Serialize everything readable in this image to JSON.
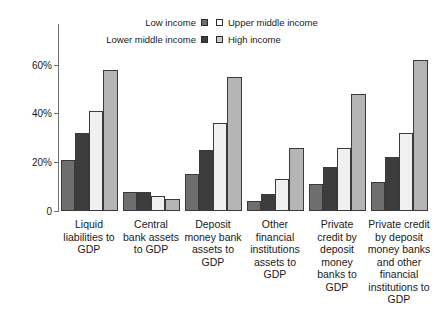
{
  "chart_data": {
    "type": "bar",
    "title": "",
    "subtitle": "",
    "xlabel": "",
    "ylabel": "",
    "ylim": [
      0,
      66
    ],
    "grid": false,
    "legend_position": "top-center",
    "ytick_labels": [
      "60%",
      "40%",
      "20%",
      "0"
    ],
    "ytick_values": [
      60,
      40,
      20,
      0
    ],
    "categories": [
      "Liquid liabilities to GDP",
      "Central bank assets to GDP",
      "Deposit money bank assets to GDP",
      "Other financial institutions assets to GDP",
      "Private credit by deposit money banks to GDP",
      "Private credit by deposit money banks and other financial institutions to GDP"
    ],
    "category_lines": [
      [
        "Liquid",
        "liabilities to",
        "GDP"
      ],
      [
        "Central",
        "bank assets",
        "to GDP"
      ],
      [
        "Deposit",
        "money bank",
        "assets to",
        "GDP"
      ],
      [
        "Other",
        "financial",
        "institutions",
        "assets to",
        "GDP"
      ],
      [
        "Private",
        "credit by",
        "deposit",
        "money",
        "banks to",
        "GDP"
      ],
      [
        "Private credit",
        "by deposit",
        "money banks",
        "and other",
        "financial",
        "institutions to",
        "GDP"
      ]
    ],
    "series": [
      {
        "name": "Low income",
        "color": "#6e6e6e",
        "values": [
          21,
          8,
          15,
          4,
          11,
          12
        ]
      },
      {
        "name": "Lower middle income",
        "color": "#3d3d3d",
        "values": [
          32,
          8,
          25,
          7,
          18,
          22
        ]
      },
      {
        "name": "Upper middle income",
        "color": "#f0f0f0",
        "values": [
          41,
          6,
          36,
          13,
          26,
          32
        ]
      },
      {
        "name": "High income",
        "color": "#b5b5b5",
        "values": [
          58,
          5,
          55,
          26,
          48,
          62
        ]
      }
    ]
  },
  "legend": {
    "left_column": [
      {
        "label": "Low income",
        "swatch": "#6e6e6e"
      },
      {
        "label": "Lower middle income",
        "swatch": "#3d3d3d"
      }
    ],
    "right_column": [
      {
        "label": "Upper middle income",
        "swatch": "#ffffff"
      },
      {
        "label": "High income",
        "swatch": "#c9c9c9"
      }
    ]
  }
}
